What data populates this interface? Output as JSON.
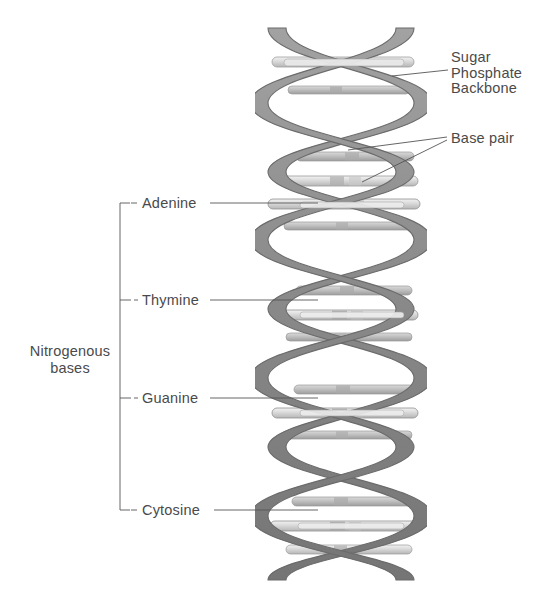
{
  "diagram": {
    "background_color": "#ffffff",
    "ribbon_color": "#8d8d8d",
    "ribbon_edge_color": "#6f6f6f",
    "rung_color": "#d8d8d8",
    "rung_edge_color": "#9a9a9a",
    "leader_color": "#555555",
    "text_color": "#4a4a4a"
  },
  "labels": {
    "sugar_phosphate_backbone": {
      "line1": "Sugar",
      "line2": "Phosphate",
      "line3": "Backbone"
    },
    "base_pair": "Base pair",
    "nitrogenous_bases": {
      "line1": "Nitrogenous",
      "line2": "bases"
    },
    "bases": [
      {
        "name": "Adenine",
        "y": 203
      },
      {
        "name": "Thymine",
        "y": 300
      },
      {
        "name": "Guanine",
        "y": 398
      },
      {
        "name": "Cytosine",
        "y": 510
      }
    ]
  },
  "helix": {
    "turns": 4,
    "left_x": 262,
    "right_x": 420,
    "top_y": 28,
    "bottom_y": 578,
    "period": 137,
    "strand_count": 2,
    "base_pair_groups": 4
  }
}
